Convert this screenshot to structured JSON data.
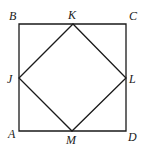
{
  "diagram": {
    "type": "geometry",
    "stroke_color": "#1a1a1a",
    "background_color": "#ffffff",
    "points": {
      "A": {
        "label": "A",
        "x": 19,
        "y": 131
      },
      "B": {
        "label": "B",
        "x": 19,
        "y": 24
      },
      "C": {
        "label": "C",
        "x": 126,
        "y": 24
      },
      "D": {
        "label": "D",
        "x": 126,
        "y": 131
      },
      "J": {
        "label": "J",
        "x": 19,
        "y": 78
      },
      "K": {
        "label": "K",
        "x": 73,
        "y": 24
      },
      "L": {
        "label": "L",
        "x": 126,
        "y": 78
      },
      "M": {
        "label": "M",
        "x": 72,
        "y": 131
      }
    },
    "outer_square": [
      "A",
      "B",
      "C",
      "D"
    ],
    "inner_square": [
      "J",
      "K",
      "L",
      "M"
    ],
    "labels": {
      "A": "A",
      "B": "B",
      "C": "C",
      "D": "D",
      "J": "J",
      "K": "K",
      "L": "L",
      "M": "M"
    }
  }
}
